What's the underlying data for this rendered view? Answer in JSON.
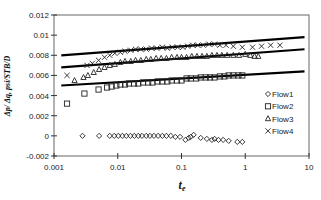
{
  "chart_data": {
    "type": "scatter",
    "title": "",
    "xlabel": "t_e",
    "xlabel_main": "t",
    "xlabel_sub": "e",
    "ylabel": "Δp/ Δq, psi/STB/D",
    "xscale": "log",
    "xlim": [
      0.001,
      10
    ],
    "ylim": [
      -0.002,
      0.012
    ],
    "x_ticks": [
      0.001,
      0.01,
      0.1,
      1,
      10
    ],
    "x_tick_labels": [
      "0.001",
      "0.01",
      "0.1",
      "1",
      "10"
    ],
    "y_ticks": [
      -0.002,
      0,
      0.002,
      0.004,
      0.006,
      0.008,
      0.01,
      0.012
    ],
    "y_tick_labels": [
      "-0.002",
      "0",
      "0.002",
      "0.004",
      "0.006",
      "0.008",
      "0.01",
      "0.012"
    ],
    "grid": false,
    "legend_position": "inside-right",
    "series": [
      {
        "name": "Flow1",
        "marker": "diamond",
        "x": [
          0.0028,
          0.0051,
          0.0075,
          0.0088,
          0.0102,
          0.0118,
          0.0136,
          0.0158,
          0.0182,
          0.021,
          0.024,
          0.028,
          0.032,
          0.037,
          0.043,
          0.05,
          0.058,
          0.068,
          0.08,
          0.095,
          0.115,
          0.13,
          0.14,
          0.155,
          0.2,
          0.25,
          0.3,
          0.33,
          0.38,
          0.45,
          0.55,
          0.75,
          0.9
        ],
        "y": [
          0.0,
          0.0,
          0.0,
          0.0,
          0.0,
          0.0,
          0.0,
          0.0,
          0.0,
          0.0,
          0.0,
          0.0,
          0.0,
          0.0,
          0.0,
          0.0,
          0.0,
          0.0,
          -0.0001,
          -0.0001,
          -0.0004,
          -0.0002,
          -0.0001,
          0.0001,
          -0.0002,
          -0.0003,
          -0.0004,
          -0.0003,
          -0.0004,
          -0.0004,
          -0.0005,
          -0.0006,
          -0.0006
        ]
      },
      {
        "name": "Flow2",
        "marker": "square",
        "x": [
          0.0016,
          0.003,
          0.005,
          0.0068,
          0.008,
          0.0095,
          0.011,
          0.013,
          0.015,
          0.018,
          0.021,
          0.025,
          0.03,
          0.035,
          0.042,
          0.05,
          0.06,
          0.07,
          0.085,
          0.1,
          0.12,
          0.14,
          0.17,
          0.2,
          0.24,
          0.28,
          0.33,
          0.4,
          0.47,
          0.55,
          0.65,
          0.78,
          0.9
        ],
        "y": [
          0.0032,
          0.0042,
          0.0046,
          0.0048,
          0.0049,
          0.005,
          0.0051,
          0.0051,
          0.0052,
          0.0052,
          0.0052,
          0.0053,
          0.0053,
          0.0053,
          0.0054,
          0.0054,
          0.0054,
          0.0055,
          0.0055,
          0.0055,
          0.0057,
          0.0057,
          0.0057,
          0.0058,
          0.0058,
          0.0058,
          0.0058,
          0.0059,
          0.0059,
          0.006,
          0.006,
          0.006,
          0.006
        ]
      },
      {
        "name": "Flow3",
        "marker": "triangle",
        "x": [
          0.0021,
          0.0029,
          0.0034,
          0.0042,
          0.0051,
          0.0062,
          0.0075,
          0.009,
          0.011,
          0.013,
          0.016,
          0.019,
          0.023,
          0.028,
          0.033,
          0.04,
          0.048,
          0.058,
          0.07,
          0.085,
          0.1,
          0.12,
          0.145,
          0.175,
          0.21,
          0.25,
          0.3,
          0.36,
          0.43,
          0.52,
          0.65,
          0.8,
          1.0,
          1.2,
          1.4,
          1.6
        ],
        "y": [
          0.0055,
          0.0058,
          0.006,
          0.0063,
          0.0066,
          0.0068,
          0.007,
          0.0071,
          0.0073,
          0.0074,
          0.0074,
          0.0075,
          0.0075,
          0.0076,
          0.0076,
          0.0077,
          0.0077,
          0.0077,
          0.0078,
          0.0078,
          0.0078,
          0.0078,
          0.0079,
          0.0079,
          0.0079,
          0.0079,
          0.008,
          0.008,
          0.008,
          0.008,
          0.008,
          0.008,
          0.0081,
          0.008,
          0.0079,
          0.0079
        ]
      },
      {
        "name": "Flow4",
        "marker": "x",
        "x": [
          0.0016,
          0.0033,
          0.004,
          0.005,
          0.0062,
          0.0075,
          0.009,
          0.011,
          0.013,
          0.016,
          0.019,
          0.023,
          0.028,
          0.034,
          0.041,
          0.05,
          0.06,
          0.072,
          0.087,
          0.105,
          0.125,
          0.15,
          0.18,
          0.22,
          0.27,
          0.33,
          0.4,
          0.5,
          0.65,
          0.9,
          1.3,
          1.8,
          2.5,
          3.5
        ],
        "y": [
          0.006,
          0.007,
          0.0072,
          0.0075,
          0.0078,
          0.008,
          0.0082,
          0.0083,
          0.0084,
          0.0085,
          0.0086,
          0.0086,
          0.0086,
          0.0087,
          0.0087,
          0.0088,
          0.0087,
          0.0088,
          0.0088,
          0.0088,
          0.0089,
          0.009,
          0.009,
          0.009,
          0.0091,
          0.0091,
          0.009,
          0.009,
          0.0089,
          0.0088,
          0.0088,
          0.0089,
          0.009,
          0.009
        ]
      }
    ],
    "fit_lines": [
      {
        "name": "fit-upper",
        "x": [
          0.0013,
          8.5
        ],
        "y": [
          0.008,
          0.0098
        ]
      },
      {
        "name": "fit-middle",
        "x": [
          0.0013,
          8.5
        ],
        "y": [
          0.0068,
          0.0086
        ]
      },
      {
        "name": "fit-lower",
        "x": [
          0.0013,
          8.5
        ],
        "y": [
          0.005,
          0.0064
        ]
      }
    ]
  }
}
